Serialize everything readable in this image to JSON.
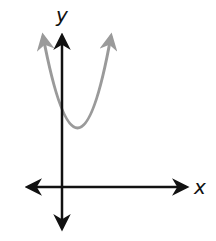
{
  "diagram": {
    "type": "graph-of-parabola",
    "axes": {
      "x_label": "x",
      "y_label": "y"
    },
    "curve": {
      "kind": "upward-opening parabola",
      "vertex_position": "right of y-axis, above x-axis",
      "color": "#9a9a9a"
    },
    "axis_color": "#111111"
  }
}
